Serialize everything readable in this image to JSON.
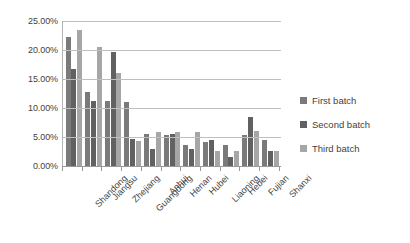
{
  "chart_data": {
    "type": "bar",
    "title": "",
    "subtitle": "",
    "xlabel": "",
    "ylabel": "",
    "ylim": [
      0,
      25
    ],
    "ytick_labels": [
      "0.00%",
      "5.00%",
      "10.00%",
      "15.00%",
      "20.00%",
      "25.00%"
    ],
    "ytick_values": [
      0,
      5,
      10,
      15,
      20,
      25
    ],
    "grid": true,
    "legend_position": "right",
    "categories": [
      "Shandong",
      "Jiangsu",
      "Zhejiang",
      "Guangdong",
      "Anhui",
      "Henan",
      "Hubei",
      "Liaoning",
      "Hebei",
      "Fujian",
      "Shanxi"
    ],
    "series": [
      {
        "name": "First batch",
        "color": "#7a7a7a",
        "values": [
          22.3,
          12.7,
          11.2,
          11.0,
          5.5,
          5.4,
          3.6,
          4.2,
          3.6,
          5.3,
          4.4
        ]
      },
      {
        "name": "Second batch",
        "color": "#616161",
        "values": [
          16.8,
          11.2,
          19.6,
          4.6,
          2.9,
          5.5,
          2.9,
          4.4,
          1.6,
          8.5,
          2.6
        ]
      },
      {
        "name": "Third batch",
        "color": "#a6a6a6",
        "values": [
          23.4,
          20.5,
          16.1,
          4.3,
          5.8,
          5.8,
          5.8,
          2.6,
          2.6,
          6.1,
          2.6
        ]
      }
    ]
  },
  "legend": {
    "items": [
      {
        "label": "First batch"
      },
      {
        "label": "Second batch"
      },
      {
        "label": "Third batch"
      }
    ]
  }
}
